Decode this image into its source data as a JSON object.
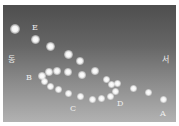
{
  "diagram": {
    "directions": {
      "east": "동",
      "west": "서"
    },
    "labels": [
      {
        "id": "E",
        "text": "E",
        "x": 32,
        "y": 24
      },
      {
        "id": "B",
        "text": "B",
        "x": 26,
        "y": 74
      },
      {
        "id": "C",
        "text": "C",
        "x": 70,
        "y": 105
      },
      {
        "id": "D",
        "text": "D",
        "x": 117,
        "y": 100
      },
      {
        "id": "A",
        "text": "A",
        "x": 160,
        "y": 110
      }
    ],
    "points": [
      {
        "x": 15,
        "y": 29,
        "r": 5
      },
      {
        "x": 35,
        "y": 39,
        "r": 4.5
      },
      {
        "x": 50,
        "y": 46,
        "r": 4.5
      },
      {
        "x": 68,
        "y": 54,
        "r": 4.5
      },
      {
        "x": 80,
        "y": 61,
        "r": 4
      },
      {
        "x": 49,
        "y": 72,
        "r": 4
      },
      {
        "x": 57,
        "y": 71,
        "r": 4
      },
      {
        "x": 68,
        "y": 72,
        "r": 4
      },
      {
        "x": 82,
        "y": 75,
        "r": 4
      },
      {
        "x": 95,
        "y": 71,
        "r": 4
      },
      {
        "x": 42,
        "y": 76,
        "r": 4
      },
      {
        "x": 44,
        "y": 81,
        "r": 3.5
      },
      {
        "x": 50,
        "y": 86,
        "r": 3.5
      },
      {
        "x": 58,
        "y": 89,
        "r": 3.5
      },
      {
        "x": 68,
        "y": 93,
        "r": 3.5
      },
      {
        "x": 80,
        "y": 96,
        "r": 3.5
      },
      {
        "x": 92,
        "y": 99,
        "r": 3.5
      },
      {
        "x": 101,
        "y": 98,
        "r": 3.5
      },
      {
        "x": 110,
        "y": 96,
        "r": 3.5
      },
      {
        "x": 115,
        "y": 91,
        "r": 3.5
      },
      {
        "x": 111,
        "y": 84,
        "r": 3.5
      },
      {
        "x": 117,
        "y": 83,
        "r": 3.5
      },
      {
        "x": 106,
        "y": 79,
        "r": 3.5
      },
      {
        "x": 133,
        "y": 88,
        "r": 3.5
      },
      {
        "x": 148,
        "y": 92,
        "r": 3.5
      },
      {
        "x": 163,
        "y": 99,
        "r": 3.5
      }
    ]
  }
}
